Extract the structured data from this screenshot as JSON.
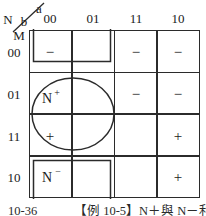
{
  "figure": {
    "type": "karnaugh-map",
    "corner": {
      "top_right_var": "a",
      "second_var": "b",
      "left_var": "N",
      "bottom_var": "M"
    },
    "column_headers": [
      "00",
      "01",
      "11",
      "10"
    ],
    "row_headers": [
      "00",
      "01",
      "11",
      "10"
    ],
    "cells": [
      [
        "−",
        "",
        "−",
        "−"
      ],
      [
        "",
        "",
        "−",
        "−"
      ],
      [
        "+",
        "",
        "",
        "+"
      ],
      [
        "",
        "",
        "",
        "+"
      ]
    ],
    "groups": [
      {
        "label_base": "N",
        "label_sup": "+",
        "shape": "ellipse"
      },
      {
        "label_base": "N",
        "label_sup": "−",
        "shape": "rectangle"
      }
    ],
    "caption": {
      "figure_number": "10-36",
      "example_text": "【例 10-5】N＋與 N－利出"
    },
    "colors": {
      "line": "#2b2b2b",
      "text": "#1a1a1a",
      "background": "#ffffff"
    }
  }
}
